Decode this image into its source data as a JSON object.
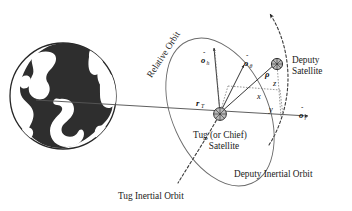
{
  "figure": {
    "background_color": "#ffffff",
    "width": 352,
    "height": 211
  },
  "colors": {
    "earth_land": "#2e2e2e",
    "earth_outline": "#262626",
    "orbit_gray": "#6b6b6b",
    "dashed_orbit": "#3a3a3a",
    "axis": "#555555",
    "vector": "#2b2b2b",
    "component_guide": "#777777",
    "satellite_fill": "#b8b8b8",
    "text": "#1a1a1a"
  },
  "bodies": {
    "earth": {
      "name": "Earth",
      "shape": "filled-circle-with-continents"
    },
    "tug_satellite": {
      "label_line1": "Tug (or Chief)",
      "label_line2": "Satellite",
      "marker": "hatched-circle"
    },
    "deputy_satellite": {
      "label_line1": "Deputy",
      "label_line2": "Satellite",
      "marker": "hatched-circle"
    }
  },
  "orbits": [
    {
      "id": "relative-orbit",
      "label": "Relative Orbit",
      "style": "solid-gray-ellipse",
      "rotated_label": true
    },
    {
      "id": "tug-inertial-orbit",
      "label": "Tug Inertial Orbit",
      "style": "dashed"
    },
    {
      "id": "deputy-inertial-orbit",
      "label": "Deputy Inertial Orbit",
      "style": "dashed-with-arrow"
    }
  ],
  "vectors": [
    {
      "id": "r-T",
      "symbol": "r",
      "subscript": "T",
      "description": "position vector of Tug from Earth center",
      "bold": true
    },
    {
      "id": "rho",
      "symbol": "ρ",
      "subscript": "",
      "description": "relative position vector from Tug to Deputy",
      "bold": true
    },
    {
      "id": "o-hat-r",
      "symbol": "o",
      "subscript": "r",
      "hat": true,
      "description": "radial unit vector"
    },
    {
      "id": "o-hat-theta",
      "symbol": "o",
      "subscript": "θ",
      "hat": true,
      "description": "along-track unit vector"
    },
    {
      "id": "o-hat-h",
      "symbol": "o",
      "subscript": "h",
      "hat": true,
      "description": "orbit normal unit vector"
    }
  ],
  "components": [
    {
      "id": "x-component",
      "symbol": "x"
    },
    {
      "id": "y-component",
      "symbol": "y"
    },
    {
      "id": "z-component",
      "symbol": "z"
    }
  ],
  "labels": {
    "relative_orbit": "Relative Orbit",
    "tug_inertial_orbit": "Tug Inertial Orbit",
    "deputy_inertial_orbit": "Deputy Inertial Orbit",
    "deputy_satellite_line1": "Deputy",
    "deputy_satellite_line2": "Satellite",
    "tug_satellite_line1": "Tug (or Chief)",
    "tug_satellite_line2": "Satellite",
    "r_symbol": "r",
    "r_subscript": "T",
    "rho_symbol": "ρ",
    "o_symbol": "o",
    "sub_r": "r",
    "sub_theta": "θ",
    "sub_h": "h",
    "hat_glyph": "ˆ",
    "x": "x",
    "y": "y",
    "z": "z"
  }
}
